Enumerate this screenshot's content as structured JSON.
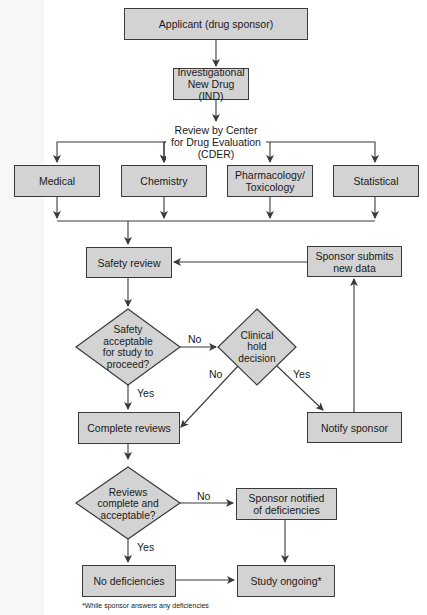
{
  "diagram": {
    "nodes": {
      "applicant": "Applicant (drug sponsor)",
      "ind_line1": "Investigational",
      "ind_line2": "New Drug (IND)",
      "review_line1": "Review by Center",
      "review_line2": "for Drug Evaluation",
      "review_line3": "(CDER)",
      "medical": "Medical",
      "chemistry": "Chemistry",
      "pharm_line1": "Pharmacology/",
      "pharm_line2": "Toxicology",
      "statistical": "Statistical",
      "safety_review": "Safety review",
      "sponsor_submits_line1": "Sponsor submits",
      "sponsor_submits_line2": "new data",
      "safety_q_line1": "Safety",
      "safety_q_line2": "acceptable",
      "safety_q_line3": "for study to",
      "safety_q_line4": "proceed?",
      "hold_line1": "Clinical",
      "hold_line2": "hold",
      "hold_line3": "decision",
      "complete_reviews": "Complete reviews",
      "notify_sponsor": "Notify sponsor",
      "reviews_q_line1": "Reviews",
      "reviews_q_line2": "complete and",
      "reviews_q_line3": "acceptable?",
      "sponsor_notified_line1": "Sponsor notified",
      "sponsor_notified_line2": "of deficiencies",
      "no_deficiencies": "No deficiencies",
      "study_ongoing": "Study ongoing*"
    },
    "edge_labels": {
      "safety_no": "No",
      "safety_yes": "Yes",
      "hold_no": "No",
      "hold_yes": "Yes",
      "reviews_no": "No",
      "reviews_yes": "Yes"
    },
    "footnote": "*While sponsor answers any deficiencies",
    "colors": {
      "box_fill": "#d3d3d3",
      "line": "#3a3a3a",
      "background": "#ffffff"
    }
  }
}
